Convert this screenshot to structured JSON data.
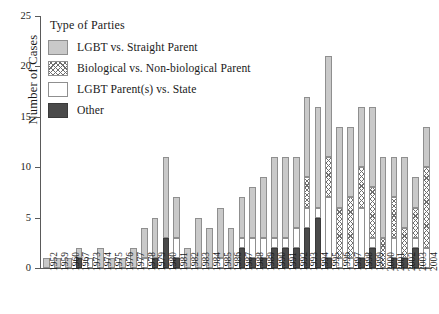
{
  "chart_data": {
    "type": "bar",
    "title": "",
    "xlabel": "",
    "ylabel": "Number of Cases",
    "ylim": [
      0,
      25
    ],
    "yticks": [
      0,
      5,
      10,
      15,
      20,
      25
    ],
    "grid": false,
    "stacked": true,
    "legend_position": "top-left-inside",
    "legend_title": "Type of Parties",
    "categories": [
      "1952",
      "1959",
      "1960",
      "1967",
      "1973",
      "1974",
      "1975",
      "1976",
      "1977",
      "1978",
      "1979",
      "1980",
      "1981",
      "1982",
      "1983",
      "1984",
      "1985",
      "1986",
      "1987",
      "1988",
      "1989",
      "1990",
      "1991",
      "1992",
      "1993",
      "1994",
      "1995",
      "1996",
      "1997",
      "1998",
      "1999",
      "2000",
      "2001",
      "2002",
      "2003",
      "2004"
    ],
    "series": [
      {
        "name": "LGBT vs. Straight Parent",
        "color": "#c9c9c9",
        "pattern": "solid-light-gray",
        "values": [
          1,
          1,
          1,
          1,
          0,
          2,
          1,
          1,
          2,
          3,
          4,
          8,
          4,
          2,
          5,
          4,
          5,
          4,
          4,
          5,
          6,
          8,
          8,
          7,
          8,
          10,
          10,
          8,
          7,
          6,
          8,
          8,
          4,
          7,
          3,
          4
        ]
      },
      {
        "name": "Biological vs. Non-biological Parent",
        "color": "#ffffff",
        "pattern": "cross-hatch",
        "values": [
          0,
          0,
          0,
          0,
          0,
          0,
          0,
          0,
          0,
          0,
          0,
          0,
          0,
          0,
          0,
          0,
          0,
          0,
          0,
          0,
          0,
          0,
          0,
          0,
          3,
          0,
          4,
          5,
          6,
          4,
          5,
          3,
          4,
          3,
          3,
          8
        ]
      },
      {
        "name": "LGBT Parent(s) vs. State",
        "color": "#ffffff",
        "pattern": "solid-white",
        "values": [
          0,
          0,
          0,
          0,
          1,
          0,
          0,
          0,
          0,
          1,
          0,
          0,
          2,
          0,
          0,
          0,
          1,
          0,
          1,
          2,
          2,
          1,
          1,
          2,
          2,
          1,
          6,
          1,
          1,
          5,
          1,
          0,
          2,
          0,
          1,
          2
        ]
      },
      {
        "name": "Other",
        "color": "#4a4a4a",
        "pattern": "solid-dark",
        "values": [
          0,
          0,
          0,
          1,
          0,
          0,
          0,
          0,
          0,
          0,
          1,
          3,
          1,
          0,
          0,
          0,
          0,
          0,
          2,
          1,
          1,
          2,
          2,
          2,
          4,
          5,
          1,
          0,
          0,
          1,
          2,
          0,
          1,
          1,
          2,
          0
        ]
      }
    ],
    "totals": [
      1,
      1,
      1,
      2,
      1,
      2,
      1,
      1,
      2,
      4,
      5,
      11,
      7,
      2,
      5,
      4,
      6,
      4,
      7,
      8,
      9,
      11,
      11,
      11,
      17,
      16,
      21,
      14,
      14,
      16,
      16,
      11,
      11,
      11,
      9,
      14
    ]
  },
  "legend": {
    "title": "Type of Parties",
    "items": [
      {
        "label": "LGBT vs. Straight Parent"
      },
      {
        "label": "Biological vs. Non-biological Parent"
      },
      {
        "label": "LGBT Parent(s) vs. State"
      },
      {
        "label": "Other"
      }
    ]
  },
  "axes": {
    "y_title": "Number of Cases",
    "y_tick_labels": [
      "0",
      "5",
      "10",
      "15",
      "20",
      "25"
    ]
  }
}
